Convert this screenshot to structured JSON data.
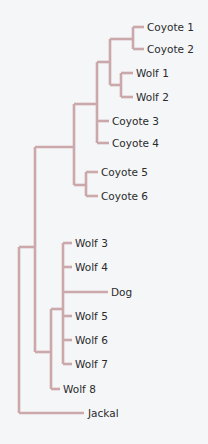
{
  "diagram": {
    "type": "phylogenetic-tree",
    "branch_color": "#cba9aa",
    "text_color": "#2b2b2b",
    "background_color": "#f4f6f8",
    "leaves": [
      {
        "id": "coyote1",
        "label": "Coyote 1",
        "x": 147,
        "y": 27
      },
      {
        "id": "coyote2",
        "label": "Coyote 2",
        "x": 147,
        "y": 49
      },
      {
        "id": "wolf1",
        "label": "Wolf 1",
        "x": 136,
        "y": 73
      },
      {
        "id": "wolf2",
        "label": "Wolf 2",
        "x": 136,
        "y": 97
      },
      {
        "id": "coyote3",
        "label": "Coyote 3",
        "x": 112,
        "y": 121
      },
      {
        "id": "coyote4",
        "label": "Coyote 4",
        "x": 112,
        "y": 143
      },
      {
        "id": "coyote5",
        "label": "Coyote 5",
        "x": 101,
        "y": 172
      },
      {
        "id": "coyote6",
        "label": "Coyote 6",
        "x": 101,
        "y": 196
      },
      {
        "id": "wolf3",
        "label": "Wolf 3",
        "x": 75,
        "y": 243
      },
      {
        "id": "wolf4",
        "label": "Wolf 4",
        "x": 75,
        "y": 267
      },
      {
        "id": "dog",
        "label": "Dog",
        "x": 111,
        "y": 292
      },
      {
        "id": "wolf5",
        "label": "Wolf 5",
        "x": 75,
        "y": 316
      },
      {
        "id": "wolf6",
        "label": "Wolf 6",
        "x": 75,
        "y": 340
      },
      {
        "id": "wolf7",
        "label": "Wolf 7",
        "x": 75,
        "y": 364
      },
      {
        "id": "wolf8",
        "label": "Wolf 8",
        "x": 63,
        "y": 389
      },
      {
        "id": "jackal",
        "label": "Jackal",
        "x": 88,
        "y": 413
      }
    ],
    "branches": [
      "M133,27 H144",
      "M133,49 H144",
      "M133,27 V49",
      "M110,39 H133",
      "M121,73 H133",
      "M121,97 H133",
      "M121,73 V97",
      "M110,85 H121",
      "M110,39 V85",
      "M97,62 H110",
      "M97,121 H109",
      "M97,143 H109",
      "M97,62 V143",
      "M74,104 H97",
      "M86,172 H98",
      "M86,196 H98",
      "M86,172 V196",
      "M74,185 H86",
      "M74,104 V185",
      "M35,147 H74",
      "M63,243 H72",
      "M63,267 H72",
      "M63,292 H108",
      "M63,316 H72",
      "M63,340 H72",
      "M63,364 H72",
      "M63,243 V364",
      "M51,309 H63",
      "M51,389 H60",
      "M51,309 V389",
      "M35,352 H51",
      "M35,147 V352",
      "M19,247 H35",
      "M19,413 H84",
      "M19,247 V413"
    ]
  }
}
